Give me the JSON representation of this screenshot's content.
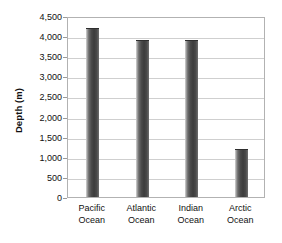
{
  "chart_data": {
    "type": "bar",
    "title": "",
    "xlabel": "",
    "ylabel": "Depth (m)",
    "categories": [
      "Pacific Ocean",
      "Atlantic Ocean",
      "Indian Ocean",
      "Arctic Ocean"
    ],
    "category_lines": [
      [
        "Pacific",
        "Ocean"
      ],
      [
        "Atlantic",
        "Ocean"
      ],
      [
        "Indian",
        "Ocean"
      ],
      [
        "Arctic",
        "Ocean"
      ]
    ],
    "values": [
      4200,
      3900,
      3900,
      1200
    ],
    "ylim": [
      0,
      4500
    ],
    "ytick_values": [
      0,
      500,
      1000,
      1500,
      2000,
      2500,
      3000,
      3500,
      4000,
      4500
    ],
    "ytick_labels": [
      "0",
      "500",
      "1,000",
      "1,500",
      "2,000",
      "2,500",
      "3,000",
      "3,500",
      "4,000",
      "4,500"
    ],
    "grid": true,
    "grid_axis": "y",
    "legend": false,
    "legend_position": "none",
    "bar_color": "#4a4a4a",
    "gridline_color": "#cfcfcf",
    "axis_color": "#b2b2b2",
    "background_color": "#ffffff",
    "text_color": "#111111"
  }
}
